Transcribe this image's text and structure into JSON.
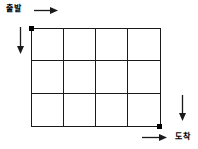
{
  "diagram": {
    "type": "grid-path-diagram",
    "start_label": "출발",
    "arrival_label": "도착",
    "grid": {
      "columns": 4,
      "rows": 3
    },
    "markers": {
      "start_dot_position": "grid top-left corner",
      "end_dot_position": "grid bottom-right corner"
    },
    "icons": {
      "top": "arrow-right",
      "left_side": "arrow-down",
      "right_side": "arrow-down",
      "bottom": "arrow-right"
    },
    "colors": {
      "line": "#1a1a1a",
      "text": "#000000",
      "background": "#ffffff"
    }
  }
}
